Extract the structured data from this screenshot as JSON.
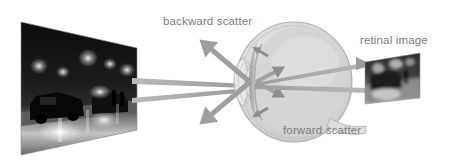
{
  "figure": {
    "width": 449,
    "height": 166,
    "background_color": "#ffffff"
  },
  "labels": {
    "backward_scatter": "backward scatter",
    "retinal_image": "retinal image",
    "forward_scatter": "forward scatter"
  },
  "colors": {
    "label_text": "#7d7d7d",
    "ray_gray": "#a8a8a8",
    "arrow_gray": "#969696",
    "eye_outline": "#b5b5b5",
    "eye_fill": "#d6d6d6",
    "vitreous_fill": "#cfcfcf",
    "retina_band": "#9a9a9a",
    "photo_dark": "#141414",
    "photo_light": "#f2f2f2"
  },
  "scene": {
    "source_photo": {
      "name": "night-street-scene-photo",
      "description": "Night street scene with car headlights and glare",
      "shape": "parallelogram"
    },
    "retinal_photo": {
      "name": "retinal-image-photo",
      "description": "Blurred night street scene projected on the retina",
      "shape": "parallelogram"
    },
    "eye": {
      "name": "eye-cross-section",
      "parts": [
        "cornea",
        "lens",
        "vitreous",
        "retina",
        "optic-nerve"
      ]
    },
    "rays": {
      "incoming_count": 2,
      "backward_scatter_arrows": 2,
      "forward_scatter_arrows": 2,
      "retinal_arrows": 2,
      "transmitted_count": 2
    }
  }
}
